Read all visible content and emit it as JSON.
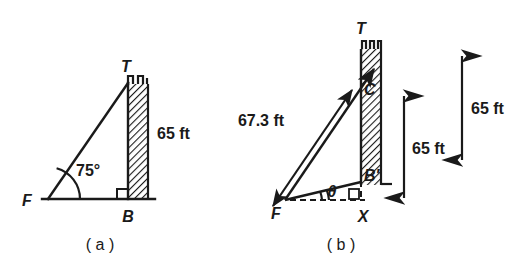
{
  "figure": {
    "background": "#ffffff",
    "ink": "#1a1a1a",
    "panels": [
      {
        "id": "panel-a",
        "caption": "( a )",
        "vertex_labels": {
          "top": "T",
          "left": "F",
          "bottom": "B"
        },
        "angle_label": "75°",
        "dimension_label": "65 ft",
        "geometry": {
          "F": [
            48,
            199
          ],
          "T": [
            128,
            83
          ],
          "B": [
            128,
            199
          ],
          "wall_left_x": 127,
          "wall_right_x": 148,
          "wall_top_y": 83,
          "wall_bottom_y": 200,
          "ground_left_x": 42,
          "ground_right_x": 155,
          "angle_arc_radius": 30,
          "right_angle_size": 9
        }
      },
      {
        "id": "panel-b",
        "caption": "( b )",
        "vertex_labels": {
          "tower_top": "T",
          "cable_point": "C",
          "wall_base": "B′",
          "observer": "F",
          "foot": "X"
        },
        "angle_label": "θ",
        "slant_label": "67.3 ft",
        "dimension_labels": [
          "65 ft",
          "65 ft"
        ],
        "geometry": {
          "F": [
            285,
            200
          ],
          "C": [
            361,
            88
          ],
          "Bp": [
            361,
            182
          ],
          "X": [
            361,
            200
          ],
          "wall_left_x": 361,
          "wall_right_x": 381,
          "wall_top_y": 48,
          "wall_bottom_y": 185,
          "arrow_tip": [
            372,
            72
          ],
          "slant_dim_from": [
            272,
            205
          ],
          "slant_dim_to": [
            348,
            93
          ],
          "angle_arc_radius": 36,
          "right_angle_size": 9,
          "dim_arrow_1": {
            "x": 404,
            "y_top": 95,
            "y_bottom": 198
          },
          "dim_arrow_2": {
            "x": 462,
            "y_top": 55,
            "y_bottom": 160
          }
        }
      }
    ]
  }
}
